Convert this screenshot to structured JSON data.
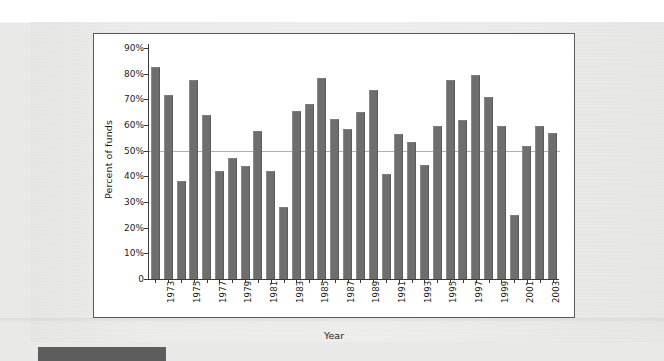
{
  "page": {
    "background_color": "#e9e9e7",
    "paper_color": "#ebebe9",
    "footer_strip_color": "#5d5d5d"
  },
  "chart_frame": {
    "background_color": "#ffffff",
    "border_color": "#5a5a5a"
  },
  "chart_data": {
    "type": "bar",
    "title": "",
    "subtitle": "",
    "xlabel": "Year",
    "ylabel": "Percent of funds",
    "grid": false,
    "legend": null,
    "bar_color": "#6e6e6e",
    "reference_line": {
      "value": 50,
      "color": "#b0b0b0",
      "orientation": "horizontal"
    },
    "ylim": [
      0,
      90
    ],
    "ytick_values": [
      0,
      10,
      20,
      30,
      40,
      50,
      60,
      70,
      80,
      90
    ],
    "ytick_labels": [
      "0",
      "10%",
      "20%",
      "30%",
      "40%",
      "50%",
      "60%",
      "70%",
      "80%",
      "90%"
    ],
    "xtick_labels": [
      "1973",
      "1975",
      "1977",
      "1979",
      "1981",
      "1983",
      "1985",
      "1987",
      "1989",
      "1991",
      "1993",
      "1995",
      "1997",
      "1999",
      "2001",
      "2003"
    ],
    "categories": [
      "1972",
      "1973",
      "1974",
      "1975",
      "1976",
      "1977",
      "1978",
      "1979",
      "1980",
      "1981",
      "1982",
      "1983",
      "1984",
      "1985",
      "1986",
      "1987",
      "1988",
      "1989",
      "1990",
      "1991",
      "1992",
      "1993",
      "1994",
      "1995",
      "1996",
      "1997",
      "1998",
      "1999",
      "2000",
      "2001",
      "2002",
      "2003"
    ],
    "values": [
      82.5,
      71.5,
      38,
      77.5,
      64,
      42,
      47,
      44,
      57.5,
      42,
      28,
      65.5,
      68,
      78.5,
      62.5,
      58.5,
      65,
      73.5,
      41,
      56.5,
      53.5,
      44.5,
      59.5,
      77.5,
      62,
      79.5,
      71,
      59.5,
      25,
      52,
      59.5,
      57
    ]
  }
}
